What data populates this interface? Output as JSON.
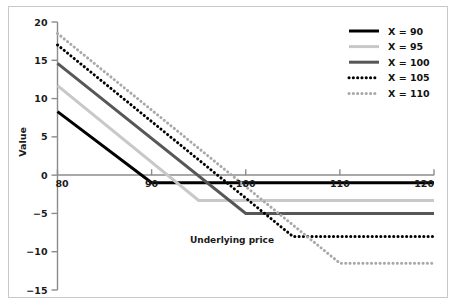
{
  "chart_data": {
    "type": "line",
    "title": "",
    "xlabel": "Underlying price",
    "ylabel": "Value",
    "xlim": [
      80,
      120
    ],
    "ylim": [
      -15,
      20
    ],
    "xticks": [
      80,
      90,
      100,
      110,
      120
    ],
    "yticks": [
      20,
      15,
      10,
      5,
      0,
      -5,
      -10,
      -15
    ],
    "xtick_labels": [
      "80",
      "90",
      "100",
      "110",
      "120"
    ],
    "ytick_labels": [
      "20",
      "15",
      "10",
      "5",
      "0",
      "-5",
      "-10",
      "-15"
    ],
    "grid": false,
    "legend_position": "upper right",
    "annotations": [
      {
        "text": "Underlying price",
        "x": 99,
        "y": -8.2
      }
    ],
    "x": [
      80,
      120
    ],
    "series": [
      {
        "name": "X = 90",
        "label": "X = 90",
        "color": "#000000",
        "style": "solid",
        "width": 3.0,
        "kink_x": 90,
        "points": [
          {
            "x": 80,
            "y": 8.3
          },
          {
            "x": 90,
            "y": -1.0
          },
          {
            "x": 120,
            "y": -1.0
          }
        ]
      },
      {
        "name": "X = 95",
        "label": "X = 95",
        "color": "#c8c8c8",
        "style": "solid",
        "width": 3.0,
        "kink_x": 95,
        "points": [
          {
            "x": 80,
            "y": 11.7
          },
          {
            "x": 95,
            "y": -3.3
          },
          {
            "x": 120,
            "y": -3.3
          }
        ]
      },
      {
        "name": "X = 100",
        "label": "X = 100",
        "color": "#575757",
        "style": "solid",
        "width": 3.0,
        "kink_x": 100,
        "points": [
          {
            "x": 80,
            "y": 14.6
          },
          {
            "x": 100,
            "y": -5.0
          },
          {
            "x": 120,
            "y": -5.0
          }
        ]
      },
      {
        "name": "X = 105",
        "label": "X = 105",
        "color": "#000000",
        "style": "dotted",
        "width": 3.0,
        "kink_x": 105,
        "points": [
          {
            "x": 80,
            "y": 17.0
          },
          {
            "x": 105,
            "y": -8.0
          },
          {
            "x": 120,
            "y": -8.0
          }
        ]
      },
      {
        "name": "X = 110",
        "label": "X = 110",
        "color": "#a8a8a8",
        "style": "dotted",
        "width": 3.0,
        "kink_x": 110,
        "points": [
          {
            "x": 80,
            "y": 18.5
          },
          {
            "x": 110,
            "y": -11.5
          },
          {
            "x": 120,
            "y": -11.5
          }
        ]
      }
    ]
  },
  "axes": {
    "y_axis_title": "Value",
    "x_axis_title": "Underlying price",
    "y_ticks": [
      {
        "label": "20",
        "value": 20
      },
      {
        "label": "15",
        "value": 15
      },
      {
        "label": "10",
        "value": 10
      },
      {
        "label": "5",
        "value": 5
      },
      {
        "label": "0",
        "value": 0
      },
      {
        "label": "-5",
        "value": -5
      },
      {
        "label": "-10",
        "value": -10
      },
      {
        "label": "-15",
        "value": -15
      }
    ],
    "x_ticks": [
      {
        "label": "80",
        "value": 80
      },
      {
        "label": "90",
        "value": 90
      },
      {
        "label": "100",
        "value": 100
      },
      {
        "label": "110",
        "value": 110
      },
      {
        "label": "120",
        "value": 120
      }
    ]
  },
  "legend": {
    "items": [
      {
        "label": "X = 90",
        "color": "#000000",
        "style": "solid"
      },
      {
        "label": "X = 95",
        "color": "#c8c8c8",
        "style": "solid"
      },
      {
        "label": "X = 100",
        "color": "#575757",
        "style": "solid"
      },
      {
        "label": "X = 105",
        "color": "#000000",
        "style": "dotted"
      },
      {
        "label": "X = 110",
        "color": "#a8a8a8",
        "style": "dotted"
      }
    ]
  },
  "colors": {
    "background": "#ffffff",
    "frame": "#c9c9c9",
    "axis": "#8c8c8c",
    "text": "#1a1a1a"
  }
}
